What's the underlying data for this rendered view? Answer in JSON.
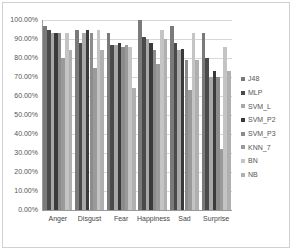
{
  "chart_data": {
    "type": "bar",
    "title": "",
    "xlabel": "",
    "ylabel": "",
    "ylim": [
      0,
      100
    ],
    "y_ticks": [
      "0.00%",
      "10.00%",
      "20.00%",
      "30.00%",
      "40.00%",
      "50.00%",
      "60.00%",
      "70.00%",
      "80.00%",
      "90.00%",
      "100.00%"
    ],
    "grid": true,
    "legend_position": "right",
    "categories": [
      "Anger",
      "Disgust",
      "Fear",
      "Happiness",
      "Sad",
      "Surprise"
    ],
    "series": [
      {
        "name": "J48",
        "color": "#7a7a7a",
        "values": [
          97,
          95,
          93,
          100,
          97,
          93
        ]
      },
      {
        "name": "MLP",
        "color": "#4a4a4a",
        "values": [
          95,
          88,
          87,
          91,
          88,
          80
        ]
      },
      {
        "name": "SVM_L",
        "color": "#a8a8a8",
        "values": [
          93,
          93,
          87,
          90,
          84,
          70
        ]
      },
      {
        "name": "SVM_P2",
        "color": "#3a3a3a",
        "values": [
          93,
          95,
          88,
          88,
          85,
          73
        ]
      },
      {
        "name": "SVM_P3",
        "color": "#8c8c8c",
        "values": [
          93,
          93,
          86,
          84,
          79,
          70
        ]
      },
      {
        "name": "KNN_7",
        "color": "#9a9a9a",
        "values": [
          80,
          75,
          87,
          77,
          63,
          32
        ]
      },
      {
        "name": "BN",
        "color": "#c4c4c4",
        "values": [
          93,
          95,
          86,
          95,
          93,
          86
        ]
      },
      {
        "name": "NB",
        "color": "#b0b0b0",
        "values": [
          84,
          84,
          64,
          90,
          79,
          73
        ]
      }
    ]
  }
}
